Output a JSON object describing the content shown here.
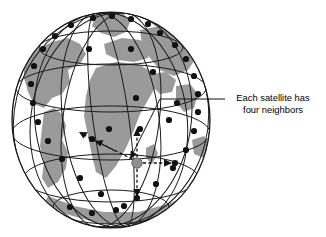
{
  "figure": {
    "background_color": "#ffffff",
    "width": 326,
    "height": 237
  },
  "globe": {
    "center_x": 111,
    "center_y": 120,
    "radius_x": 99,
    "radius_y": 108,
    "ocean_color": "#ffffff",
    "land_color": "#9a9a9a",
    "outline_color": "#1a1a1a",
    "grid_color": "#1a1a1a",
    "label": "Earth"
  },
  "satellites": {
    "dot_color": "#111111",
    "dot_radius": 3.1,
    "highlight_color": "#8f8f8f",
    "highlight_radius": 5.2,
    "highlighted_label": "Selected satellite",
    "count_visible": 36,
    "positions": [
      [
        93,
        18
      ],
      [
        112,
        16
      ],
      [
        131,
        19
      ],
      [
        148,
        24
      ],
      [
        71,
        25
      ],
      [
        55,
        36
      ],
      [
        43,
        49
      ],
      [
        160,
        33
      ],
      [
        175,
        45
      ],
      [
        186,
        59
      ],
      [
        34,
        66
      ],
      [
        31,
        84
      ],
      [
        33,
        103
      ],
      [
        194,
        76
      ],
      [
        198,
        94
      ],
      [
        198,
        112
      ],
      [
        38,
        122
      ],
      [
        48,
        141
      ],
      [
        62,
        159
      ],
      [
        194,
        131
      ],
      [
        186,
        150
      ],
      [
        173,
        168
      ],
      [
        80,
        178
      ],
      [
        101,
        194
      ],
      [
        124,
        206
      ],
      [
        156,
        184
      ],
      [
        137,
        198
      ],
      [
        116,
        210
      ],
      [
        92,
        213
      ],
      [
        70,
        207
      ],
      [
        89,
        49
      ],
      [
        131,
        49
      ],
      [
        153,
        72
      ],
      [
        136,
        98
      ],
      [
        92,
        139
      ],
      [
        169,
        120
      ],
      [
        177,
        103
      ],
      [
        109,
        129
      ],
      [
        140,
        129
      ],
      [
        136,
        196
      ]
    ],
    "highlighted_position": [
      137,
      163
    ]
  },
  "neighbor_arrows": {
    "style": "dashed",
    "color": "#111111",
    "description": "Four dashed arrows from the highlighted satellite to its four neighbors",
    "targets": [
      {
        "name": "north-neighbor",
        "x": 137,
        "y": 133
      },
      {
        "name": "south-neighbor",
        "x": 137,
        "y": 194
      },
      {
        "name": "east-neighbor",
        "x": 172,
        "y": 163
      },
      {
        "name": "west-neighbor",
        "x": 97,
        "y": 141
      }
    ]
  },
  "callout": {
    "text_line_1": "Each satellite has",
    "text_line_2": "four neighbors",
    "text_x": 273,
    "text_y_1": 101,
    "text_y_2": 113,
    "leader_color": "#111111",
    "leader_horizontal": {
      "x1": 225,
      "y1": 99,
      "x2": 160,
      "y2": 99
    },
    "leader_diagonal": {
      "x1": 160,
      "y1": 99,
      "x2": 131,
      "y2": 153
    }
  }
}
